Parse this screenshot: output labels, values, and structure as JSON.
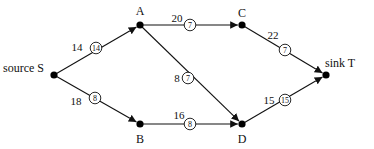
{
  "diagram": {
    "type": "flow-network",
    "nodes": [
      {
        "id": "S",
        "label": "source S",
        "x": 54,
        "y": 75,
        "label_x": 3,
        "label_y": 72,
        "anchor": "start"
      },
      {
        "id": "A",
        "label": "A",
        "x": 140,
        "y": 25,
        "label_x": 140,
        "label_y": 15,
        "anchor": "middle"
      },
      {
        "id": "C",
        "label": "C",
        "x": 242,
        "y": 25,
        "label_x": 242,
        "label_y": 17,
        "anchor": "middle"
      },
      {
        "id": "T",
        "label": "sink T",
        "x": 326,
        "y": 75,
        "label_x": 325,
        "label_y": 67,
        "anchor": "start"
      },
      {
        "id": "B",
        "label": "B",
        "x": 140,
        "y": 124,
        "label_x": 140,
        "label_y": 143,
        "anchor": "middle"
      },
      {
        "id": "D",
        "label": "D",
        "x": 242,
        "y": 124,
        "label_x": 242,
        "label_y": 143,
        "anchor": "middle"
      }
    ],
    "edges": [
      {
        "from": "S",
        "to": "A",
        "capacity": "14",
        "flow": "14",
        "cap_x": 77,
        "cap_y": 51,
        "circle_x": 96,
        "circle_y": 48
      },
      {
        "from": "S",
        "to": "B",
        "capacity": "18",
        "flow": "8",
        "cap_x": 76,
        "cap_y": 105,
        "circle_x": 95,
        "circle_y": 98
      },
      {
        "from": "A",
        "to": "C",
        "capacity": "20",
        "flow": "7",
        "cap_x": 177,
        "cap_y": 22,
        "circle_x": 190,
        "circle_y": 25
      },
      {
        "from": "A",
        "to": "D",
        "capacity": "8",
        "flow": "7",
        "cap_x": 177,
        "cap_y": 82,
        "circle_x": 188,
        "circle_y": 78
      },
      {
        "from": "C",
        "to": "T",
        "capacity": "22",
        "flow": "7",
        "cap_x": 273,
        "cap_y": 39,
        "circle_x": 285,
        "circle_y": 50
      },
      {
        "from": "B",
        "to": "D",
        "capacity": "16",
        "flow": "8",
        "cap_x": 179,
        "cap_y": 119,
        "circle_x": 190,
        "circle_y": 124
      },
      {
        "from": "D",
        "to": "T",
        "capacity": "15",
        "flow": "15",
        "cap_x": 269,
        "cap_y": 104,
        "circle_x": 285,
        "circle_y": 100
      }
    ]
  }
}
